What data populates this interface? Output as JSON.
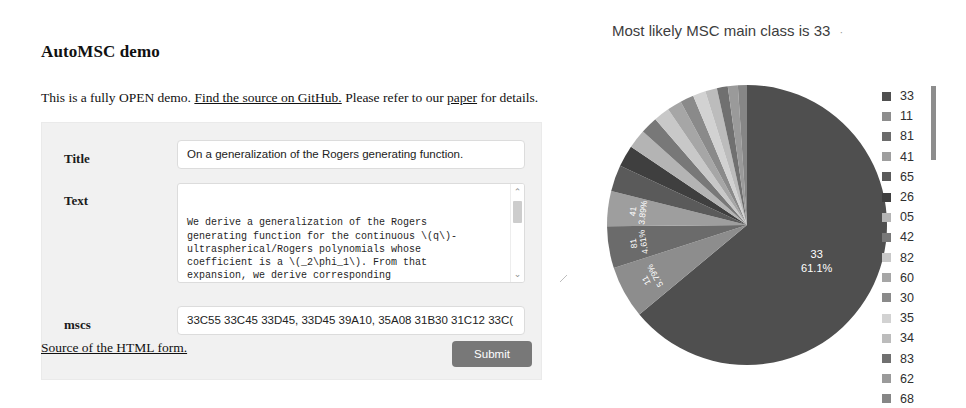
{
  "page": {
    "title": "AutoMSC demo"
  },
  "intro": {
    "before_link1": "This is a fully OPEN demo. ",
    "link1": "Find the source on GitHub.",
    "between_links": " Please refer to our ",
    "link2": "paper",
    "after_link2": " for details."
  },
  "form": {
    "title_label": "Title",
    "title_value": "On a generalization of the Rogers generating function.",
    "title_placeholder": "Title",
    "text_label": "Text",
    "text_value": "We derive a generalization of the Rogers\ngenerating function for the continuous \\(q\\)-\nultraspherical/Rogers polynomials whose\ncoefficient is a \\(_2\\phi_1\\). From that\nexpansion, we derive corresponding\nspecialization and limit transition expansions\nfor the continuous \\(q\\)-Hermite, continuous\n",
    "text_placeholder": "Text",
    "mscs_label": "mscs",
    "mscs_value": "33C55 33C45 33D45, 33D45 39A10, 35A08 31B30 31C12 33C(",
    "mscs_placeholder": "mscs",
    "source_link": "Source of the HTML form.",
    "submit_label": "Submit",
    "scroll_up_icon": "⌃",
    "scroll_down_icon": "⌄"
  },
  "result": {
    "heading": "Most likely MSC main class is 33",
    "heading_dot": "·"
  },
  "chart_data": {
    "type": "pie",
    "title": "Most likely MSC main class is 33",
    "legend_position": "right",
    "categories": [
      "33",
      "11",
      "81",
      "41",
      "65",
      "26",
      "05",
      "42",
      "82",
      "60",
      "30",
      "35",
      "34",
      "83",
      "62",
      "68"
    ],
    "values": [
      61.1,
      5.79,
      4.61,
      3.89,
      2.89,
      2.4,
      2.1,
      1.9,
      1.75,
      1.6,
      1.5,
      1.4,
      1.3,
      1.2,
      1.1,
      1.0
    ],
    "unit": "%",
    "labelled_slices": [
      {
        "category": "33",
        "percent": "61.1%"
      },
      {
        "category": "11",
        "percent": "5.79%"
      },
      {
        "category": "81",
        "percent": "4.61%"
      },
      {
        "category": "41",
        "percent": "3.89%"
      }
    ],
    "colors": [
      "#4f4f4f",
      "#8d8d8d",
      "#6b6b6b",
      "#9e9e9e",
      "#5a5a5a",
      "#3f3f3f",
      "#b4b4b4",
      "#787878",
      "#c8c8c8",
      "#a6a6a6",
      "#8a8a8a",
      "#d2d2d2",
      "#bcbcbc",
      "#707070",
      "#9a9a9a",
      "#868686"
    ]
  }
}
